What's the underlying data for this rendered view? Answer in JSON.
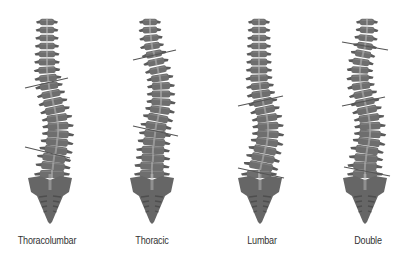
{
  "figure": {
    "title": "",
    "colors": {
      "vertebra": "#6e6e6e",
      "vertebra_dark": "#5a5a5a",
      "vertebra_light": "#8c8c8c",
      "disc": "#ffffff",
      "sacrum": "#666666",
      "sacrum_ridge": "#4e4e4e",
      "canal": "#b8b8b8",
      "cobb_line": "#555555",
      "label_text": "#333333",
      "background": "#ffffff"
    },
    "spines": [
      {
        "id": "thoracolumbar",
        "label": "Thoracolumbar",
        "label_x": 47,
        "vertebrae_x": [
          47,
          47,
          47,
          47,
          47,
          47,
          47,
          48,
          49,
          51,
          53,
          55,
          57,
          58,
          58,
          57,
          56,
          54,
          53,
          52
        ],
        "vertebrae_y_start": 22,
        "vertebra_spacing": 8,
        "sacrum": {
          "cx": 50,
          "top": 178
        },
        "cobb_lines": [
          {
            "x1": 25,
            "y1": 88,
            "x2": 68,
            "y2": 78
          },
          {
            "x1": 25,
            "y1": 147,
            "x2": 70,
            "y2": 158
          }
        ]
      },
      {
        "id": "thoracic",
        "label": "Thoracic",
        "label_x": 152,
        "vertebrae_x": [
          150,
          150,
          151,
          152,
          154,
          156,
          158,
          160,
          161,
          161,
          161,
          160,
          158,
          156,
          155,
          154,
          153,
          153,
          152,
          152
        ],
        "vertebrae_y_start": 22,
        "vertebra_spacing": 8,
        "sacrum": {
          "cx": 152,
          "top": 178
        },
        "cobb_lines": [
          {
            "x1": 133,
            "y1": 60,
            "x2": 176,
            "y2": 50
          },
          {
            "x1": 133,
            "y1": 126,
            "x2": 178,
            "y2": 136
          }
        ]
      },
      {
        "id": "lumbar",
        "label": "Lumbar",
        "label_x": 262,
        "vertebrae_x": [
          259,
          259,
          259,
          259,
          259,
          259,
          259,
          259,
          260,
          261,
          263,
          265,
          267,
          268,
          268,
          267,
          265,
          263,
          261,
          259
        ],
        "vertebrae_y_start": 22,
        "vertebra_spacing": 8,
        "sacrum": {
          "cx": 260,
          "top": 178
        },
        "cobb_lines": [
          {
            "x1": 238,
            "y1": 106,
            "x2": 283,
            "y2": 96
          },
          {
            "x1": 238,
            "y1": 168,
            "x2": 284,
            "y2": 178
          }
        ]
      },
      {
        "id": "double",
        "label": "Double",
        "label_x": 368,
        "vertebrae_x": [
          367,
          367,
          366,
          365,
          363,
          361,
          360,
          360,
          361,
          363,
          365,
          367,
          369,
          370,
          370,
          369,
          367,
          366,
          365,
          365
        ],
        "vertebrae_y_start": 22,
        "vertebra_spacing": 8,
        "sacrum": {
          "cx": 365,
          "top": 178
        },
        "cobb_lines": [
          {
            "x1": 342,
            "y1": 42,
            "x2": 388,
            "y2": 50
          },
          {
            "x1": 342,
            "y1": 106,
            "x2": 385,
            "y2": 97
          },
          {
            "x1": 344,
            "y1": 167,
            "x2": 390,
            "y2": 176
          }
        ]
      }
    ]
  }
}
